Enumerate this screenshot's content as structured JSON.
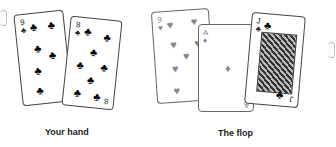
{
  "hand": {
    "label": "Your hand",
    "cards": [
      {
        "rank": "9",
        "suit": "♣",
        "suit_name": "clubs",
        "color": "#111111"
      },
      {
        "rank": "8",
        "suit": "♣",
        "suit_name": "clubs",
        "color": "#111111"
      }
    ]
  },
  "flop": {
    "label": "The flop",
    "cards": [
      {
        "rank": "9",
        "suit": "♥",
        "suit_name": "hearts",
        "color": "#888888"
      },
      {
        "rank": "A",
        "suit": "♦",
        "suit_name": "diamonds",
        "color": "#888888"
      },
      {
        "rank": "J",
        "suit": "♣",
        "suit_name": "clubs",
        "color": "#111111"
      }
    ]
  }
}
